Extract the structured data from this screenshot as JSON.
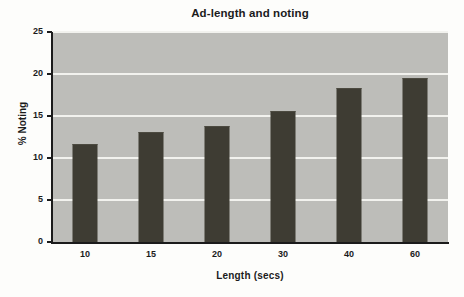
{
  "chart_data": {
    "type": "bar",
    "title": "Ad-length and noting",
    "xlabel": "Length (secs)",
    "ylabel": "% Noting",
    "categories": [
      "10",
      "15",
      "20",
      "30",
      "40",
      "60"
    ],
    "values": [
      11.5,
      13.0,
      13.7,
      15.5,
      18.2,
      19.4
    ],
    "ylim": [
      0,
      25
    ],
    "ytick_labels": [
      "0",
      "5",
      "10",
      "15",
      "20",
      "25"
    ],
    "ytick_values": [
      0,
      5,
      10,
      15,
      20,
      25
    ],
    "grid": true,
    "grid_axis": "y",
    "legend": false,
    "legend_position": "none",
    "colors": {
      "bar": "#3e3c33",
      "plot_background": "#bdbdb9",
      "gridline": "#f2f2ee",
      "axis": "#1b1b1b",
      "page_background": "#fdfdfb",
      "text": "#1b1b1b"
    }
  }
}
